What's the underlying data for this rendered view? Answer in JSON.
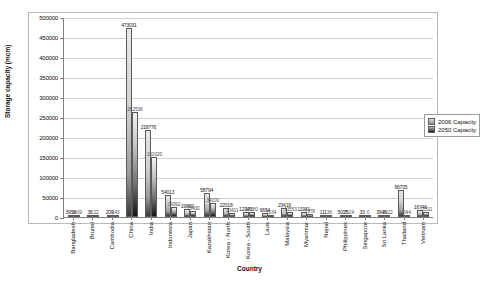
{
  "chart_data": {
    "type": "bar",
    "title": "",
    "xlabel": "Country",
    "ylabel": "Storage capacity (mcm)",
    "ylim": [
      0,
      500000
    ],
    "ytick_step": 50000,
    "yticks": [
      "0",
      "50000",
      "100000",
      "150000",
      "200000",
      "250000",
      "300000",
      "350000",
      "400000",
      "450000",
      "500000"
    ],
    "grid": true,
    "legend_position": "right",
    "categories": [
      "Bangladesh",
      "Brunei",
      "Cambodia",
      "China",
      "India",
      "Indonesia",
      "Japan",
      "Kazakhstan",
      "Korea - North",
      "Korea - South",
      "Laos",
      "Malaysia",
      "Myanmar",
      "Nepal",
      "Philippines",
      "Singapore",
      "Sri Lanka",
      "Thailand",
      "Vietnam"
    ],
    "series": [
      {
        "name": "2006 Capacity",
        "values": [
          3956,
          38,
          209,
          473031,
          218776,
          54013,
          19869,
          58794,
          22018,
          12945,
          9654,
          23419,
          11931,
          111,
          5005,
          33,
          3946,
          66705,
          16746
        ]
      },
      {
        "name": "2050 Capacity",
        "values": [
          1409,
          22,
          143,
          262536,
          150020,
          24392,
          15430,
          34100,
          10411,
          11380,
          5534,
          13553,
          7278,
          38,
          2524,
          0,
          2022,
          544,
          11511
        ]
      }
    ]
  },
  "legend": {
    "items": [
      {
        "label": "2006 Capacity",
        "color": "#cfcfcf"
      },
      {
        "label": "2050 Capacity",
        "color": "#3a3a3a"
      }
    ]
  },
  "axes": {
    "y_title": "Storage capacity (mcm)",
    "x_title": "Country"
  }
}
